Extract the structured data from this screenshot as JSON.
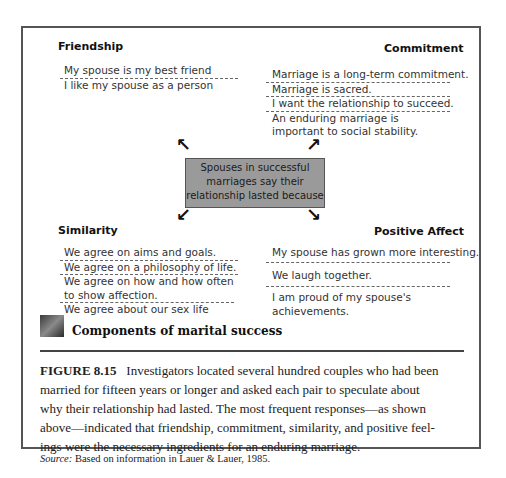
{
  "diagram": {
    "center_text": "Spouses in successful marriages say their relationship lasted because",
    "quadrants": {
      "friendship": {
        "heading": "Friendship",
        "items": [
          "My spouse is my best friend",
          "I like my spouse as a person"
        ]
      },
      "commitment": {
        "heading": "Commitment",
        "items": [
          "Marriage is a long-term commitment.",
          "Marriage is sacred.",
          "I want the relationship to succeed.",
          "An enduring marriage is important to social stability."
        ]
      },
      "similarity": {
        "heading": "Similarity",
        "items": [
          "We agree on aims and goals.",
          "We agree on a philosophy of life.",
          "We agree on how and how often to show affection.",
          "We agree about our sex life"
        ]
      },
      "positive_affect": {
        "heading": "Positive Affect",
        "items": [
          "My spouse has grown more interesting.",
          "We laugh together.",
          "I am proud of my spouse's achievements."
        ]
      }
    },
    "arrows": [
      "arrow-up-left",
      "arrow-up-right",
      "arrow-down-left",
      "arrow-down-right"
    ]
  },
  "figure": {
    "title": "Components of marital success",
    "icon": "photo-thumbnail-icon",
    "label": "FIGURE 8.15",
    "caption_lines": [
      "Investigators located several hundred couples who had been",
      "married for fifteen years or longer and asked each pair to speculate about",
      "why their relationship had lasted. The most frequent responses—as shown",
      "above—indicated that friendship, commitment, similarity, and positive feel-",
      "ings were the necessary ingredients for an enduring marriage."
    ],
    "source_label": "Source:",
    "source_text": "Based on information in Lauer & Lauer, 1985."
  }
}
